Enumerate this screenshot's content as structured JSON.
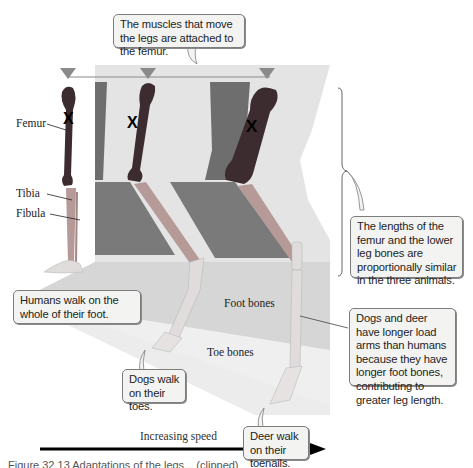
{
  "callouts": {
    "femur_muscles": "The muscles that move the legs are attached to the femur.",
    "proportions": "The lengths of the femur and the lower leg bones are proportionally similar in the three animals.",
    "human_walk": "Humans walk on the whole of their foot.",
    "dog_walk": "Dogs walk on their toes.",
    "deer_walk": "Deer walk on their toenails.",
    "load_arms": "Dogs and deer have longer load arms than humans because they have longer foot bones, contributing to greater leg length."
  },
  "labels": {
    "femur": "Femur",
    "tibia": "Tibia",
    "fibula": "Fibula",
    "foot_bones": "Foot bones",
    "toe_bones": "Toe bones"
  },
  "axis": {
    "speed_label": "Increasing speed",
    "direction": "left-to-right"
  },
  "caption": {
    "text": "Figure 32.13 Adaptations of the legs... (clipped)"
  },
  "subjects": [
    "Human",
    "Dog",
    "Deer"
  ],
  "markers": {
    "pivot_symbol": "X",
    "joint_marker": "triangle"
  },
  "colors": {
    "femur_band": "#6e6e6e",
    "lower_leg_band": "#7a7a7a",
    "panel_light": "#e4e4e4",
    "foot_band": "#d2d2d2",
    "toe_band": "#e8e8e8",
    "femur_bone": "#3c2c30",
    "lower_bone": "#b59a98",
    "marker": "#8a8a8a"
  }
}
